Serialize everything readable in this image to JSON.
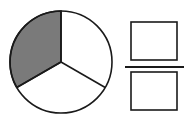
{
  "diagram": {
    "type": "fraction-circle",
    "total_parts": 3,
    "shaded_parts": 1,
    "colors": {
      "stroke": "#1a1a1a",
      "shaded": "#7a7a7a",
      "unshaded": "#ffffff",
      "background": "#ffffff"
    },
    "fraction": {
      "numerator": "",
      "denominator": ""
    }
  }
}
